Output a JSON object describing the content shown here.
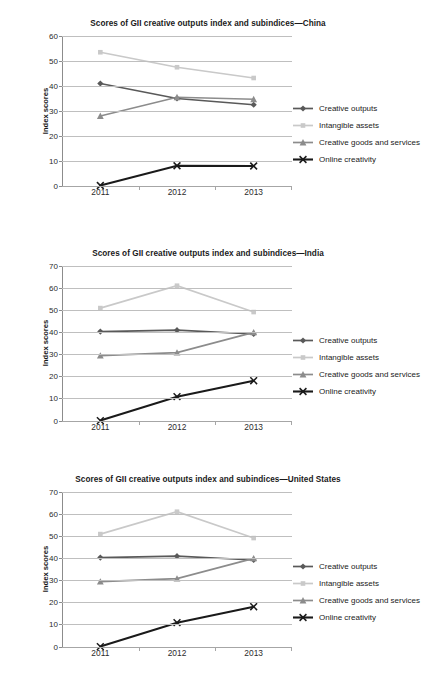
{
  "figure": {
    "ylabel": "Index scores",
    "series_names": [
      "Creative outputs",
      "Intangible assets",
      "Creative goods and services",
      "Online creativity"
    ],
    "series_colors": [
      "#595959",
      "#c9c9c9",
      "#8c8c8c",
      "#1a1a1a"
    ],
    "series_markers": [
      "diamond",
      "square",
      "triangle",
      "x"
    ]
  },
  "chart_data": [
    {
      "type": "line",
      "title": "Scores of GII creative outputs index and subindices—China",
      "xlabel": "",
      "ylabel": "Index scores",
      "categories": [
        "2011",
        "2012",
        "2013"
      ],
      "ylim": [
        0,
        60
      ],
      "yticks": [
        0,
        10,
        20,
        30,
        40,
        50,
        60
      ],
      "grid": true,
      "legend_position": "right",
      "series": [
        {
          "name": "Creative outputs",
          "values": [
            41.0,
            35.0,
            32.5
          ],
          "color": "#595959",
          "marker": "diamond"
        },
        {
          "name": "Intangible assets",
          "values": [
            53.5,
            47.5,
            43.2
          ],
          "color": "#c9c9c9",
          "marker": "square"
        },
        {
          "name": "Creative goods and services",
          "values": [
            28.0,
            35.5,
            34.7
          ],
          "color": "#8c8c8c",
          "marker": "triangle"
        },
        {
          "name": "Online creativity",
          "values": [
            0.2,
            8.1,
            8.0
          ],
          "color": "#1a1a1a",
          "marker": "x"
        }
      ]
    },
    {
      "type": "line",
      "title": "Scores of GII creative outputs index and subindices—India",
      "xlabel": "",
      "ylabel": "Index scores",
      "categories": [
        "2011",
        "2012",
        "2013"
      ],
      "ylim": [
        0,
        70
      ],
      "yticks": [
        0,
        10,
        20,
        30,
        40,
        50,
        60,
        70
      ],
      "grid": true,
      "legend_position": "right",
      "series": [
        {
          "name": "Creative outputs",
          "values": [
            40.4,
            41.0,
            39.3
          ],
          "color": "#595959",
          "marker": "diamond"
        },
        {
          "name": "Intangible assets",
          "values": [
            51.0,
            61.1,
            49.2
          ],
          "color": "#c9c9c9",
          "marker": "square"
        },
        {
          "name": "Creative goods and services",
          "values": [
            29.5,
            30.9,
            40.0
          ],
          "color": "#8c8c8c",
          "marker": "triangle"
        },
        {
          "name": "Online creativity",
          "values": [
            0.2,
            11.0,
            18.2
          ],
          "color": "#1a1a1a",
          "marker": "x"
        }
      ]
    },
    {
      "type": "line",
      "title": "Scores of GII creative outputs index and subindices—United States",
      "xlabel": "",
      "ylabel": "Index scores",
      "categories": [
        "2011",
        "2012",
        "2013"
      ],
      "ylim": [
        0,
        70
      ],
      "yticks": [
        0,
        10,
        20,
        30,
        40,
        50,
        60,
        70
      ],
      "grid": true,
      "legend_position": "right",
      "series": [
        {
          "name": "Creative outputs",
          "values": [
            40.4,
            41.0,
            39.3
          ],
          "color": "#595959",
          "marker": "diamond"
        },
        {
          "name": "Intangible assets",
          "values": [
            51.0,
            61.1,
            49.2
          ],
          "color": "#c9c9c9",
          "marker": "square"
        },
        {
          "name": "Creative goods and services",
          "values": [
            29.5,
            30.9,
            40.0
          ],
          "color": "#8c8c8c",
          "marker": "triangle"
        },
        {
          "name": "Online creativity",
          "values": [
            0.2,
            11.0,
            18.2
          ],
          "color": "#1a1a1a",
          "marker": "x"
        }
      ]
    }
  ]
}
